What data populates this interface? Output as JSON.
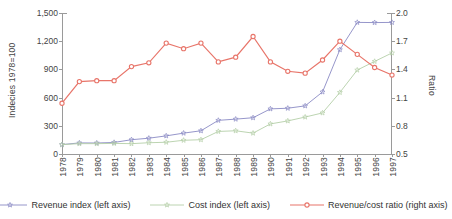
{
  "chart_data": {
    "type": "line",
    "title": "",
    "xlabel": "",
    "ylabel": "Indecies 1978=100",
    "ylabel_right": "Ratio",
    "ylim": [
      0,
      1500
    ],
    "ylim_right": [
      0.5,
      2.0
    ],
    "grid": false,
    "legend_position": "bottom",
    "categories": [
      "1978",
      "1979",
      "1980",
      "1981",
      "1982",
      "1983",
      "1984",
      "1985",
      "1986",
      "1987",
      "1988",
      "1989",
      "1990",
      "1991",
      "1992",
      "1993",
      "1994",
      "1995",
      "1996",
      "1997"
    ],
    "yticks_left": [
      "0",
      "300",
      "600",
      "900",
      "1,200",
      "1,500"
    ],
    "yticks_right": [
      "0.5",
      "0.8",
      "1.1",
      "1.4",
      "1.7",
      "2.0"
    ],
    "series": [
      {
        "name": "Revenue index (left axis)",
        "axis": "left",
        "color": "#8a8ac4",
        "marker": "star",
        "values": [
          100,
          118,
          117,
          123,
          152,
          168,
          193,
          222,
          247,
          358,
          371,
          386,
          480,
          487,
          512,
          660,
          1110,
          1400,
          1398,
          1400
        ]
      },
      {
        "name": "Cost index (left axis)",
        "axis": "left",
        "color": "#b4cfa8",
        "marker": "star",
        "values": [
          100,
          110,
          110,
          113,
          110,
          120,
          125,
          146,
          152,
          240,
          247,
          222,
          320,
          352,
          393,
          437,
          655,
          893,
          985,
          1075
        ]
      },
      {
        "name": "Revenue/cost ratio (right axis)",
        "axis": "right",
        "color": "#e8756a",
        "marker": "circle",
        "values": [
          1.04,
          1.27,
          1.28,
          1.28,
          1.43,
          1.47,
          1.68,
          1.62,
          1.68,
          1.48,
          1.53,
          1.75,
          1.48,
          1.38,
          1.36,
          1.5,
          1.7,
          1.56,
          1.42,
          1.34
        ]
      }
    ]
  },
  "axes": {
    "left_title": "Indecies 1978=100",
    "right_title": "Ratio"
  },
  "legend": {
    "items": [
      {
        "label": "Revenue index (left axis)"
      },
      {
        "label": "Cost index (left axis)"
      },
      {
        "label": "Revenue/cost ratio (right axis)"
      }
    ]
  },
  "colors": {
    "revenue": "#8a8ac4",
    "cost": "#b4cfa8",
    "ratio": "#e8756a",
    "axis": "#9a9a9a",
    "text": "#3a3a3a",
    "background": "#ffffff"
  }
}
